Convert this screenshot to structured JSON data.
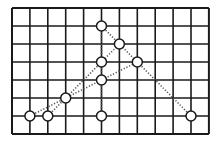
{
  "diagram": {
    "type": "grid-with-points",
    "grid": {
      "cols": 11,
      "rows": 7,
      "origin_px": [
        12,
        8
      ],
      "cell_w": 17.9,
      "cell_h": 18,
      "line_color": "#1a1a1a"
    },
    "points": [
      {
        "id": "p1",
        "col": 5,
        "row": 1
      },
      {
        "id": "p2",
        "col": 6,
        "row": 2
      },
      {
        "id": "p3",
        "col": 5,
        "row": 3
      },
      {
        "id": "p4",
        "col": 7,
        "row": 3
      },
      {
        "id": "p5",
        "col": 5,
        "row": 4
      },
      {
        "id": "p6",
        "col": 3,
        "row": 5
      },
      {
        "id": "p7",
        "col": 1,
        "row": 6
      },
      {
        "id": "p8",
        "col": 2,
        "row": 6
      },
      {
        "id": "p9",
        "col": 5,
        "row": 6
      },
      {
        "id": "p10",
        "col": 10,
        "row": 6
      }
    ],
    "dotted_lines": [
      {
        "from": [
          5,
          1
        ],
        "to": [
          5,
          6
        ],
        "name": "vertical-axis-line"
      },
      {
        "from": [
          1,
          6
        ],
        "to": [
          10,
          6
        ],
        "name": "base-line"
      },
      {
        "from": [
          5,
          1
        ],
        "to": [
          10,
          6
        ],
        "name": "right-diagonal-line"
      },
      {
        "from": [
          2,
          6
        ],
        "to": [
          6,
          2
        ],
        "name": "left-steep-diagonal-line"
      },
      {
        "from": [
          1,
          6
        ],
        "to": [
          7,
          3
        ],
        "name": "left-shallow-diagonal-line"
      }
    ],
    "point_style": {
      "radius": 5,
      "fill": "#ffffff",
      "stroke": "#1a1a1a"
    },
    "dot_color": "#555555"
  }
}
